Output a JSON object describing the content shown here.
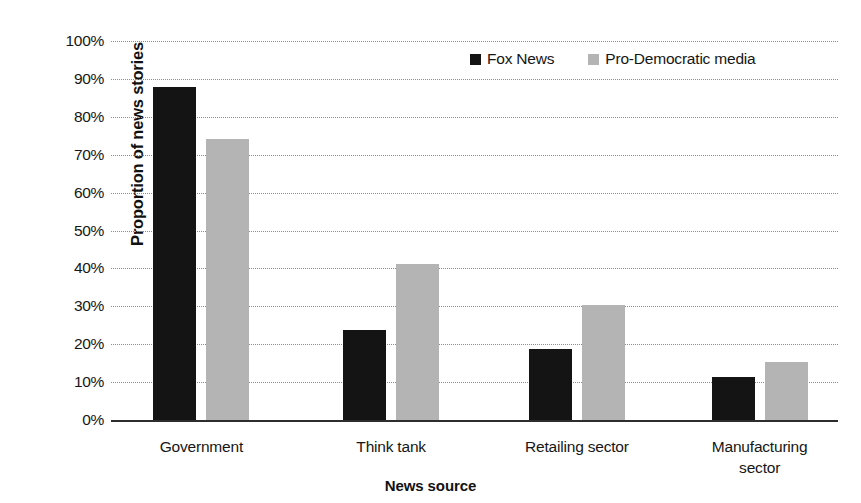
{
  "chart_data": {
    "type": "bar",
    "title": "",
    "xlabel": "News source",
    "ylabel": "Proportion of news stories",
    "categories": [
      "Government",
      "Think tank",
      "Retailing sector",
      "Manufacturing sector"
    ],
    "category_lines": [
      [
        "Government"
      ],
      [
        "Think tank"
      ],
      [
        "Retailing sector"
      ],
      [
        "Manufacturing",
        "sector"
      ]
    ],
    "series": [
      {
        "name": "Fox News",
        "color": "#141414",
        "values": [
          88,
          24,
          19,
          11.5
        ]
      },
      {
        "name": "Pro-Democratic media",
        "color": "#b4b4b4",
        "values": [
          74.5,
          41.5,
          30.5,
          15.5
        ]
      }
    ],
    "ylim": [
      0,
      100
    ],
    "ytick_step": 10,
    "ytick_labels": [
      "0%",
      "10%",
      "20%",
      "30%",
      "40%",
      "50%",
      "60%",
      "70%",
      "80%",
      "90%",
      "100%"
    ],
    "grid": true,
    "grid_axis": "y",
    "grid_style": "dotted",
    "grid_color": "#8d8d8d",
    "legend_position": "top-right",
    "axis_color": "#2d2d2d",
    "background": "#ffffff"
  }
}
